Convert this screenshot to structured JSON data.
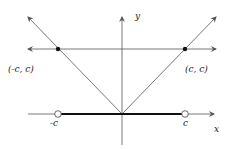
{
  "diagram": {
    "axes": {
      "x_label": "x",
      "y_label": "y"
    },
    "points": [
      {
        "label": "(-c, c)",
        "type": "filled"
      },
      {
        "label": "(c, c)",
        "type": "filled"
      }
    ],
    "x_ticks": [
      {
        "label": "-c",
        "marker": "open-circle"
      },
      {
        "label": "c",
        "marker": "open-circle"
      }
    ],
    "colors": {
      "line": "#555555",
      "thick_segment": "#111111",
      "point": "#111111"
    }
  }
}
